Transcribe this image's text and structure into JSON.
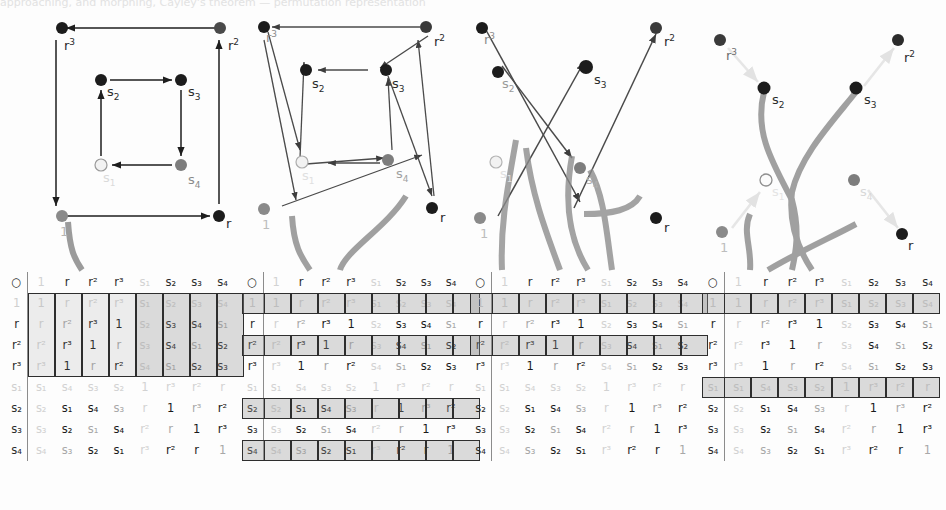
{
  "figure": {
    "topcut_text": "approaching, and morphing, Cayley's theorem — permutation representation",
    "operator_symbol": "○",
    "group_name": "D4",
    "elements": [
      "1",
      "r",
      "r²",
      "r³",
      "s₁",
      "s₂",
      "s₃",
      "s₄"
    ],
    "colors": {
      "arrow_dark": "#2b2b2b",
      "arrow_mid": "#5a5a5a",
      "arrow_faint": "#e6e6e6",
      "ribbon": "#8a8a8a",
      "node_black": "#1c1c1c",
      "node_gray": "#8a8a8a",
      "node_white": "#f2f2f2",
      "cell_shade": "#9a9a9a",
      "text_faint": "#d2d2d2"
    }
  },
  "cayley_table": {
    "corner": "○",
    "col_headers": [
      "1",
      "r",
      "r²",
      "r³",
      "s₁",
      "s₂",
      "s₃",
      "s₄"
    ],
    "row_headers": [
      "1",
      "r",
      "r²",
      "r³",
      "s₁",
      "s₂",
      "s₃",
      "s₄"
    ],
    "rows": [
      [
        "1",
        "r",
        "r²",
        "r³",
        "s₁",
        "s₂",
        "s₃",
        "s₄"
      ],
      [
        "r",
        "r²",
        "r³",
        "1",
        "s₂",
        "s₃",
        "s₄",
        "s₁"
      ],
      [
        "r²",
        "r³",
        "1",
        "r",
        "s₃",
        "s₄",
        "s₁",
        "s₂"
      ],
      [
        "r³",
        "1",
        "r",
        "r²",
        "s₄",
        "s₁",
        "s₂",
        "s₃"
      ],
      [
        "s₁",
        "s₄",
        "s₃",
        "s₂",
        "1",
        "r³",
        "r²",
        "r"
      ],
      [
        "s₂",
        "s₁",
        "s₄",
        "s₃",
        "r",
        "1",
        "r³",
        "r²"
      ],
      [
        "s₃",
        "s₂",
        "s₁",
        "s₄",
        "r²",
        "r",
        "1",
        "r³"
      ],
      [
        "s₄",
        "s₃",
        "s₂",
        "s₁",
        "r³",
        "r²",
        "r",
        "1"
      ]
    ]
  },
  "panels": [
    {
      "id": "panel-1",
      "stage_label": "square-cayley-graph",
      "highlight_mode": "columns",
      "highlight_rows": [
        0,
        1,
        2,
        3
      ],
      "nodes": [
        {
          "label": "r³",
          "tone": "black"
        },
        {
          "label": "r²",
          "tone": "black"
        },
        {
          "label": "s₂",
          "tone": "black"
        },
        {
          "label": "s₃",
          "tone": "black"
        },
        {
          "label": "s₁",
          "tone": "white"
        },
        {
          "label": "s₄",
          "tone": "gray"
        },
        {
          "label": "1",
          "tone": "gray"
        },
        {
          "label": "r",
          "tone": "black"
        }
      ]
    },
    {
      "id": "panel-2",
      "stage_label": "crossing-cayley-graph",
      "highlight_mode": "rows",
      "highlight_rows": [
        0,
        2,
        5,
        7
      ],
      "nodes": [
        {
          "label": "r³",
          "tone": "black"
        },
        {
          "label": "r²",
          "tone": "black"
        },
        {
          "label": "s₂",
          "tone": "black"
        },
        {
          "label": "s₃",
          "tone": "black"
        },
        {
          "label": "s₁",
          "tone": "white"
        },
        {
          "label": "s₄",
          "tone": "gray"
        },
        {
          "label": "1",
          "tone": "gray"
        },
        {
          "label": "r",
          "tone": "black"
        }
      ]
    },
    {
      "id": "panel-3",
      "stage_label": "diagonal-arrows-graph",
      "highlight_mode": "rows",
      "highlight_rows": [
        0,
        2
      ],
      "nodes": [
        {
          "label": "r³",
          "tone": "black"
        },
        {
          "label": "r²",
          "tone": "black"
        },
        {
          "label": "s₂",
          "tone": "black"
        },
        {
          "label": "s₃",
          "tone": "black"
        },
        {
          "label": "s₁",
          "tone": "white"
        },
        {
          "label": "s₄",
          "tone": "gray"
        },
        {
          "label": "1",
          "tone": "gray"
        },
        {
          "label": "r",
          "tone": "black"
        }
      ]
    },
    {
      "id": "panel-4",
      "stage_label": "faded-arrows-ribbons-graph",
      "highlight_mode": "rows",
      "highlight_rows": [
        0,
        4
      ],
      "nodes": [
        {
          "label": "r³",
          "tone": "gray"
        },
        {
          "label": "r²",
          "tone": "black"
        },
        {
          "label": "s₂",
          "tone": "black"
        },
        {
          "label": "s₃",
          "tone": "black"
        },
        {
          "label": "s₁",
          "tone": "white"
        },
        {
          "label": "s₄",
          "tone": "gray"
        },
        {
          "label": "1",
          "tone": "gray"
        },
        {
          "label": "r",
          "tone": "black"
        }
      ]
    }
  ]
}
